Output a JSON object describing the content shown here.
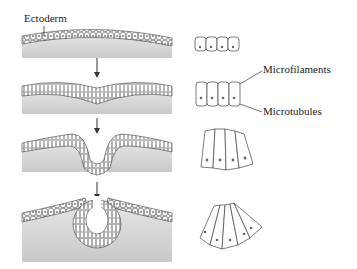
{
  "diagram": {
    "labels": {
      "ectoderm": "Ectoderm",
      "microfilaments": "Microfilaments",
      "microtubules": "Microtubules"
    },
    "stages": [
      {
        "name": "flat-ectoderm",
        "cell_shape": "cuboidal"
      },
      {
        "name": "neural-plate-thickening",
        "cell_shape": "columnar"
      },
      {
        "name": "neural-groove",
        "cell_shape": "wedge-apical-constriction"
      },
      {
        "name": "neural-tube-closing",
        "cell_shape": "wedge-strong-constriction"
      }
    ],
    "colors": {
      "tissue_fill": "#d8d8d8",
      "cell_fill": "#ffffff",
      "stroke": "#333333"
    }
  }
}
